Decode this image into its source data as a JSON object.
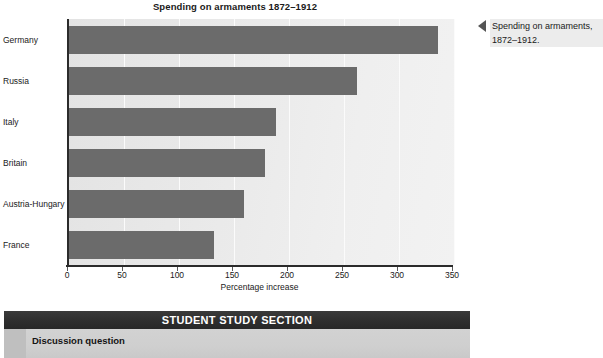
{
  "chart_data": {
    "type": "bar",
    "orientation": "horizontal",
    "title": "Spending on armaments 1872–1912",
    "xlabel": "Percentage increase",
    "ylabel": "",
    "categories": [
      "Germany",
      "Russia",
      "Italy",
      "Britain",
      "Austria-Hungary",
      "France"
    ],
    "values": [
      335,
      262,
      188,
      178,
      159,
      132
    ],
    "xlim": [
      0,
      350
    ],
    "xticks": [
      0,
      50,
      100,
      150,
      200,
      250,
      300,
      350
    ],
    "xtick_labels": [
      "0",
      "50",
      "100",
      "150",
      "200",
      "250",
      "300",
      "350"
    ],
    "grid": true,
    "grid_axis": "x",
    "legend": false,
    "bar_color": "#6b6b6b",
    "plot_background": "#e9e9e9"
  },
  "caption": {
    "marker": "left-triangle",
    "text": "Spending on armaments, 1872–1912."
  },
  "study_section": {
    "header": "STUDENT STUDY SECTION",
    "subheading": "Discussion question"
  },
  "colors": {
    "bar": "#6b6b6b",
    "axis": "#2b2b2b",
    "header_bar": "#2e2e2e",
    "study_body": "#cfcfcf",
    "caption_bg": "#ececec"
  }
}
